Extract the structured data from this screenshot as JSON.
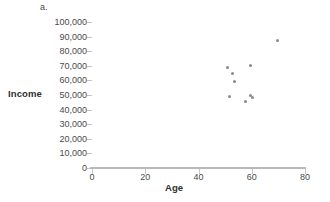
{
  "panel": {
    "letter": "a."
  },
  "chart_data": {
    "type": "scatter",
    "title": "",
    "xlabel": "Age",
    "ylabel": "Income",
    "xlim": [
      0,
      80
    ],
    "ylim": [
      0,
      100000
    ],
    "grid": false,
    "legend": null,
    "xticks": [
      0,
      20,
      40,
      60,
      80
    ],
    "xtick_labels": [
      "0",
      "20",
      "40",
      "60",
      "80"
    ],
    "yticks": [
      0,
      10000,
      20000,
      30000,
      40000,
      50000,
      60000,
      70000,
      80000,
      90000,
      100000
    ],
    "ytick_labels": [
      "0",
      "10,000",
      "20,000",
      "30,000",
      "40,000",
      "50,000",
      "60,000",
      "70,000",
      "80,000",
      "90,000",
      "100,000"
    ],
    "series": [
      {
        "name": "Age vs Income",
        "marker": "circle",
        "color": "#8a8a8a",
        "points": [
          {
            "x": 50.8,
            "y": 68500
          },
          {
            "x": 52.6,
            "y": 65000
          },
          {
            "x": 53.4,
            "y": 59000
          },
          {
            "x": 51.5,
            "y": 49000
          },
          {
            "x": 57.5,
            "y": 45500
          },
          {
            "x": 59.4,
            "y": 50000
          },
          {
            "x": 60.2,
            "y": 48500
          },
          {
            "x": 59.4,
            "y": 70000
          },
          {
            "x": 69.5,
            "y": 87500
          }
        ]
      }
    ]
  },
  "colors": {
    "axis": "#b9b9b9",
    "tick": "#c4c4c4",
    "text": "#4a4a4a",
    "title_text": "#2f2f2f",
    "marker": "#8a8a8a",
    "background": "#ffffff"
  }
}
